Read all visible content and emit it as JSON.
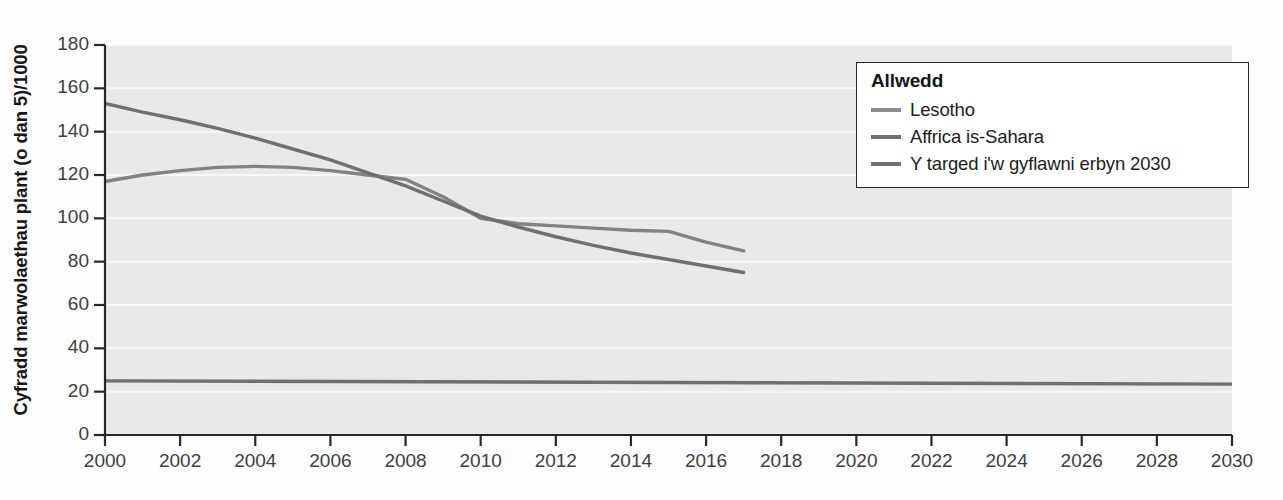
{
  "chart_data": {
    "type": "line",
    "title": "",
    "xlabel": "",
    "ylabel": "Cyfradd marwolaethau plant (o dan 5)/1000",
    "xlim": [
      2000,
      2030
    ],
    "ylim": [
      0,
      180
    ],
    "xticks": [
      2000,
      2002,
      2004,
      2006,
      2008,
      2010,
      2012,
      2014,
      2016,
      2018,
      2020,
      2022,
      2024,
      2026,
      2028,
      2030
    ],
    "yticks": [
      0,
      20,
      40,
      60,
      80,
      100,
      120,
      140,
      160,
      180
    ],
    "grid": true,
    "grid_axis": "y",
    "legend_position": "upper-right",
    "legend_title": "Allwedd",
    "plot_background": "#e9e9e9",
    "gridline_color": "#f7f7f7",
    "axis_color": "#26282b",
    "series": [
      {
        "name": "Lesotho",
        "color": "#808285",
        "x": [
          2000,
          2001,
          2002,
          2003,
          2004,
          2005,
          2006,
          2007,
          2008,
          2009,
          2010,
          2011,
          2012,
          2013,
          2014,
          2015,
          2016,
          2017
        ],
        "values": [
          117,
          120,
          122,
          123.5,
          124,
          123.5,
          122,
          120,
          118,
          110,
          100,
          97.5,
          96.5,
          95.5,
          94.5,
          94,
          89,
          85
        ]
      },
      {
        "name": "Affrica is-Sahara",
        "color": "#6e7073",
        "x": [
          2000,
          2001,
          2002,
          2003,
          2004,
          2005,
          2006,
          2007,
          2008,
          2009,
          2010,
          2011,
          2012,
          2013,
          2014,
          2015,
          2016,
          2017
        ],
        "values": [
          153,
          149,
          145.5,
          141.5,
          137,
          132,
          127,
          121,
          115,
          108,
          101,
          96,
          91.5,
          87.5,
          84,
          81,
          78,
          75
        ]
      },
      {
        "name": "Y targed i'w gyflawni erbyn 2030",
        "color": "#6e7073",
        "x": [
          2000,
          2030
        ],
        "values": [
          25,
          23.5
        ]
      }
    ]
  },
  "axes": {
    "y_tick_labels": [
      "180",
      "160",
      "140",
      "120",
      "100",
      "80",
      "60",
      "40",
      "20",
      "0"
    ],
    "x_tick_labels": [
      "2000",
      "2002",
      "2004",
      "2006",
      "2008",
      "2010",
      "2012",
      "2014",
      "2016",
      "2018",
      "2020",
      "2022",
      "2024",
      "2026",
      "2028",
      "2030"
    ]
  },
  "legend": {
    "title": "Allwedd",
    "entries": [
      {
        "label": "Lesotho",
        "color": "#8a8c8f"
      },
      {
        "label": "Affrica is-Sahara",
        "color": "#6e7073"
      },
      {
        "label": "Y targed i'w gyflawni erbyn 2030",
        "color": "#6e7073"
      }
    ]
  }
}
